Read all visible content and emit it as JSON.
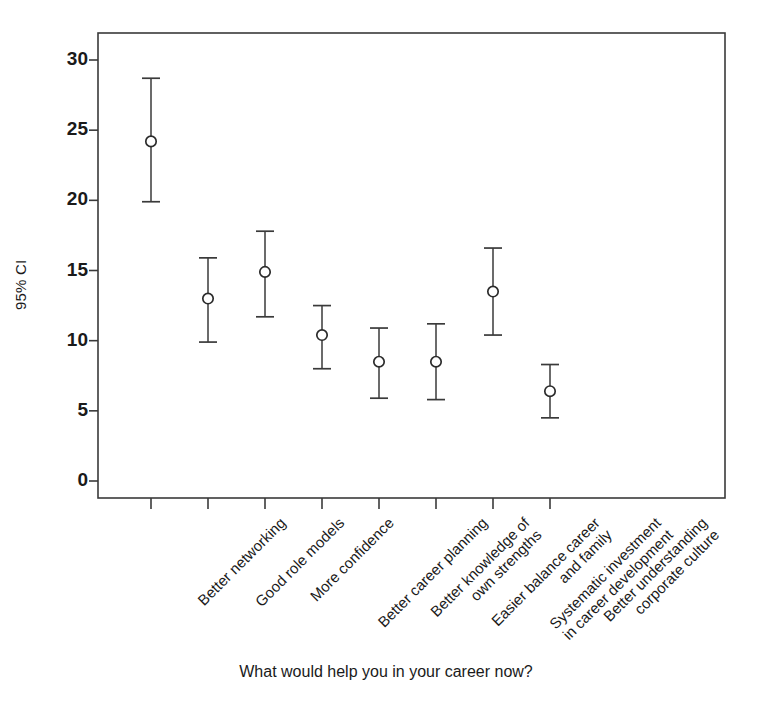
{
  "chart_data": {
    "type": "scatter",
    "title": "",
    "subtitle": "",
    "xlabel": "What would help you in your career now?",
    "ylabel": "95% CI",
    "ylim": [
      0,
      31.5
    ],
    "yticks": [
      0,
      5,
      10,
      15,
      20,
      25,
      30
    ],
    "ytick_labels": [
      "0",
      "5",
      "10",
      "15",
      "20",
      "25",
      "30"
    ],
    "grid": false,
    "legend": null,
    "marker": "open-circle",
    "error_bars": "95% confidence interval",
    "categories": [
      "Better networking",
      "Good role models",
      "More confidence",
      "Better career planning",
      "Better knowledge of own strengths",
      "Easier balance career and family",
      "Systematic investment in career development",
      "Better understanding corporate culture"
    ],
    "category_lines": [
      [
        "Better networking"
      ],
      [
        "Good role models"
      ],
      [
        "More confidence"
      ],
      [
        "Better career planning"
      ],
      [
        "Better knowledge of",
        "own strengths"
      ],
      [
        "Easier balance career",
        "and family"
      ],
      [
        "Systematic investment",
        "in career development"
      ],
      [
        "Better understanding",
        "corporate culture"
      ]
    ],
    "values": [
      24.2,
      13.0,
      14.9,
      10.4,
      8.5,
      8.5,
      13.5,
      6.4
    ],
    "ci_low": [
      19.9,
      9.9,
      11.7,
      8.0,
      5.9,
      5.8,
      10.4,
      4.5
    ],
    "ci_high": [
      28.7,
      15.9,
      17.8,
      12.5,
      10.9,
      11.2,
      16.6,
      8.3
    ],
    "points": [
      {
        "label": "Better networking",
        "mean": 24.2,
        "low": 19.9,
        "high": 28.7
      },
      {
        "label": "Good role models",
        "mean": 13.0,
        "low": 9.9,
        "high": 15.9
      },
      {
        "label": "More confidence",
        "mean": 14.9,
        "low": 11.7,
        "high": 17.8
      },
      {
        "label": "Better career planning",
        "mean": 10.4,
        "low": 8.0,
        "high": 12.5
      },
      {
        "label": "Better knowledge of own strengths",
        "mean": 8.5,
        "low": 5.9,
        "high": 10.9
      },
      {
        "label": "Easier balance career and family",
        "mean": 8.5,
        "low": 5.8,
        "high": 11.2
      },
      {
        "label": "Systematic investment in career development",
        "mean": 13.5,
        "low": 10.4,
        "high": 16.6
      },
      {
        "label": "Better understanding corporate culture",
        "mean": 6.4,
        "low": 4.5,
        "high": 8.3
      }
    ],
    "colors": {
      "axis": "#3a3a3a",
      "marker": "#2b2b2b",
      "errorbar": "#3a3a3a",
      "background": "#ffffff",
      "text": "#1a1a1a"
    }
  }
}
